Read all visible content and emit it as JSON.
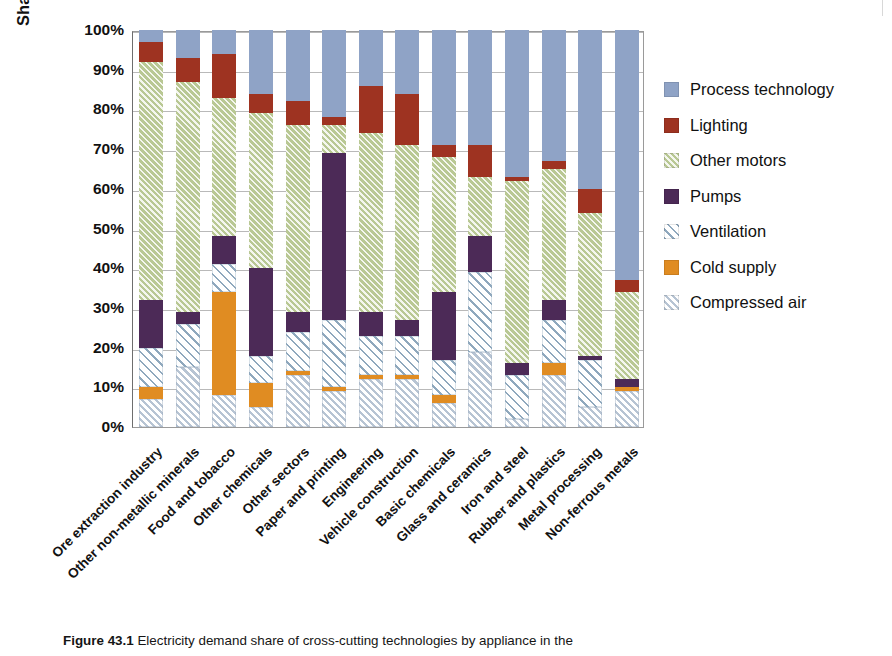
{
  "chart_data": {
    "type": "bar",
    "subtype": "stacked-bar-100-percent",
    "title": "",
    "xlabel": "",
    "ylabel": "Share of electricity demand",
    "ylim": [
      0,
      100
    ],
    "ytick_labels": [
      "100%",
      "90%",
      "80%",
      "70%",
      "60%",
      "50%",
      "40%",
      "30%",
      "20%",
      "10%",
      "0%"
    ],
    "ytick_values": [
      100,
      90,
      80,
      70,
      60,
      50,
      40,
      30,
      20,
      10,
      0
    ],
    "grid": true,
    "legend_position": "right",
    "stack_order_bottom_to_top": [
      "Compressed air",
      "Cold supply",
      "Ventilation",
      "Pumps",
      "Other motors",
      "Lighting",
      "Process technology"
    ],
    "categories": [
      "Ore extraction industry",
      "Other non-metallic minerals",
      "Food and tobacco",
      "Other chemicals",
      "Other sectors",
      "Paper and printing",
      "Engineering",
      "Vehicle construction",
      "Basic chemicals",
      "Glass and ceramics",
      "Iron and steel",
      "Rubber and plastics",
      "Metal processing",
      "Non-ferrous metals"
    ],
    "series": [
      {
        "name": "Compressed air",
        "color": "#b7c4d3",
        "pattern": "hatched",
        "values": [
          7,
          15,
          8,
          5,
          13,
          9,
          12,
          12,
          6,
          19,
          2,
          13,
          5,
          9
        ]
      },
      {
        "name": "Cold supply",
        "color": "#e08c22",
        "pattern": "solid",
        "values": [
          3,
          0,
          26,
          6,
          1,
          1,
          1,
          1,
          2,
          0,
          0,
          3,
          0,
          1
        ]
      },
      {
        "name": "Ventilation",
        "color": "#8fa8bd",
        "pattern": "hatched",
        "values": [
          10,
          11,
          7,
          7,
          10,
          17,
          10,
          10,
          9,
          20,
          11,
          11,
          12,
          0
        ]
      },
      {
        "name": "Pumps",
        "color": "#4c2a57",
        "pattern": "solid",
        "values": [
          12,
          3,
          7,
          22,
          5,
          42,
          6,
          4,
          17,
          9,
          3,
          5,
          1,
          2
        ]
      },
      {
        "name": "Other motors",
        "color": "#b9c894",
        "pattern": "hatched",
        "values": [
          60,
          58,
          35,
          39,
          47,
          7,
          45,
          44,
          34,
          15,
          46,
          33,
          36,
          22
        ]
      },
      {
        "name": "Lighting",
        "color": "#9e3321",
        "pattern": "solid",
        "values": [
          5,
          6,
          11,
          5,
          6,
          2,
          12,
          13,
          3,
          8,
          1,
          2,
          6,
          3
        ]
      },
      {
        "name": "Process technology",
        "color": "#8fa3c6",
        "pattern": "solid",
        "values": [
          3,
          7,
          6,
          16,
          18,
          22,
          14,
          16,
          29,
          29,
          37,
          33,
          40,
          63
        ]
      }
    ]
  },
  "legend": {
    "items": [
      {
        "label": "Process technology",
        "series": "Process technology"
      },
      {
        "label": "Lighting",
        "series": "Lighting"
      },
      {
        "label": "Other motors",
        "series": "Other motors"
      },
      {
        "label": "Pumps",
        "series": "Pumps"
      },
      {
        "label": "Ventilation",
        "series": "Ventilation"
      },
      {
        "label": "Cold supply",
        "series": "Cold supply"
      },
      {
        "label": "Compressed air",
        "series": "Compressed air"
      }
    ]
  },
  "caption": {
    "figure_number": "Figure 43.1",
    "text": "Electricity demand share of cross-cutting technologies by appliance in the"
  }
}
